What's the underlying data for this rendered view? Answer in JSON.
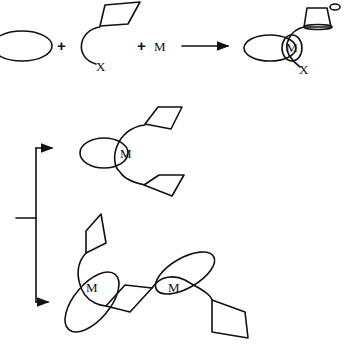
{
  "diagram": {
    "type": "reaction-scheme",
    "reactants": {
      "macrocycle": "ring",
      "plus_1": "+",
      "thread_end_label": "X",
      "plus_2": "+",
      "metal_label": "M"
    },
    "product_1": {
      "metal_label": "M",
      "end_label": "X"
    },
    "branch_top": {
      "metal_label": "M"
    },
    "branch_bottom": {
      "metal_labels": [
        "M",
        "M"
      ]
    },
    "colors": {
      "stroke": "#111111",
      "background": "#ffffff"
    }
  }
}
